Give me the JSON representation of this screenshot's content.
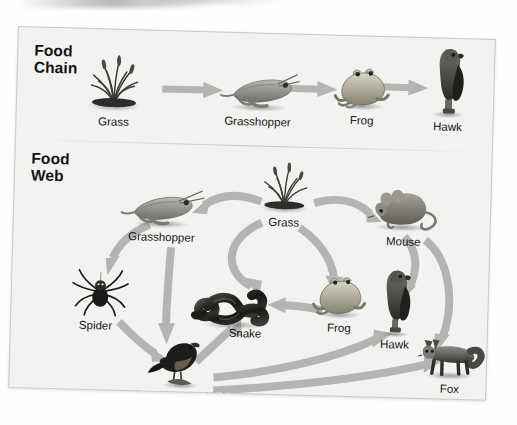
{
  "figure": {
    "type": "diagram",
    "subtype": "ecology-food-chain-and-food-web",
    "background_color": "#f2f2f0",
    "arrow_color": "#b4b4b2",
    "text_color": "#161616"
  },
  "sections": {
    "food_chain": {
      "title": "Food\nChain",
      "organisms": [
        {
          "key": "grass",
          "label": "Grass",
          "icon": "grass-icon"
        },
        {
          "key": "grasshopper",
          "label": "Grasshopper",
          "icon": "grasshopper-icon"
        },
        {
          "key": "frog",
          "label": "Frog",
          "icon": "frog-icon"
        },
        {
          "key": "hawk",
          "label": "Hawk",
          "icon": "hawk-icon"
        }
      ],
      "arrows": [
        {
          "from": "Grass",
          "to": "Grasshopper"
        },
        {
          "from": "Grasshopper",
          "to": "Frog"
        },
        {
          "from": "Frog",
          "to": "Hawk"
        }
      ]
    },
    "food_web": {
      "title": "Food\nWeb",
      "organisms": [
        {
          "key": "grass",
          "label": "Grass",
          "icon": "grass-icon"
        },
        {
          "key": "grasshopper",
          "label": "Grasshopper",
          "icon": "grasshopper-icon"
        },
        {
          "key": "mouse",
          "label": "Mouse",
          "icon": "mouse-icon"
        },
        {
          "key": "spider",
          "label": "Spider",
          "icon": "spider-icon"
        },
        {
          "key": "snake",
          "label": "Snake",
          "icon": "snake-icon"
        },
        {
          "key": "frog",
          "label": "Frog",
          "icon": "frog-icon"
        },
        {
          "key": "hawk",
          "label": "Hawk",
          "icon": "hawk-icon"
        },
        {
          "key": "fox",
          "label": "Fox",
          "icon": "fox-icon"
        },
        {
          "key": "bird",
          "label": "Insectivorous bird",
          "icon": "bird-icon"
        }
      ],
      "arrows": [
        {
          "from": "Grass",
          "to": "Grasshopper"
        },
        {
          "from": "Grass",
          "to": "Mouse"
        },
        {
          "from": "Grass",
          "to": "Frog"
        },
        {
          "from": "Grasshopper",
          "to": "Spider"
        },
        {
          "from": "Grasshopper",
          "to": "Snake"
        },
        {
          "from": "Grasshopper",
          "to": "Insectivorous bird"
        },
        {
          "from": "Spider",
          "to": "Insectivorous bird"
        },
        {
          "from": "Frog",
          "to": "Snake"
        },
        {
          "from": "Insectivorous bird",
          "to": "Snake"
        },
        {
          "from": "Insectivorous bird",
          "to": "Hawk"
        },
        {
          "from": "Insectivorous bird",
          "to": "Fox"
        },
        {
          "from": "Mouse",
          "to": "Hawk"
        },
        {
          "from": "Mouse",
          "to": "Fox"
        }
      ]
    }
  }
}
